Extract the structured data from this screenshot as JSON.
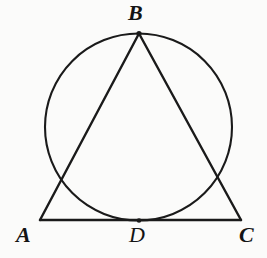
{
  "figure": {
    "type": "geometry-diagram",
    "background_color": "#fbfbfa",
    "stroke_color": "#1a1a1a",
    "width": 267,
    "height": 258,
    "points": [
      {
        "id": "A",
        "label": "A",
        "x": 40,
        "y": 220,
        "label_x": 16,
        "label_y": 224,
        "marker": false
      },
      {
        "id": "B",
        "label": "B",
        "x": 139,
        "y": 33.5,
        "label_x": 128,
        "label_y": 2,
        "marker": true
      },
      {
        "id": "C",
        "label": "C",
        "x": 241,
        "y": 220,
        "label_x": 239,
        "label_y": 224,
        "marker": false
      },
      {
        "id": "D",
        "label": "D",
        "x": 139,
        "y": 220.5,
        "label_x": 129,
        "label_y": 224,
        "marker": true
      }
    ],
    "circle": {
      "center_x": 138.5,
      "center_y": 127,
      "radius": 93.5,
      "stroke_width": 2.1
    },
    "segments": [
      {
        "id": "AB",
        "from": "A",
        "to": "B",
        "x1": 40,
        "y1": 220,
        "x2": 139,
        "y2": 33.5,
        "stroke_width": 2.4
      },
      {
        "id": "BC",
        "from": "B",
        "to": "C",
        "x1": 139,
        "y1": 33.5,
        "x2": 241,
        "y2": 220,
        "stroke_width": 2.4
      },
      {
        "id": "AC",
        "from": "A",
        "to": "C",
        "x1": 40,
        "y1": 220,
        "x2": 241,
        "y2": 220,
        "stroke_width": 2.4
      }
    ]
  }
}
